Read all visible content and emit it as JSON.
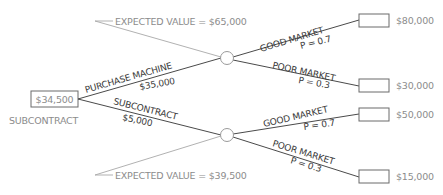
{
  "diagram": {
    "type": "decision-tree",
    "colors": {
      "branch_line": "#4a4a4a",
      "annotation_line": "#a8a8a8",
      "label_dark": "#3a3a3a",
      "label_light": "#8c8c8c"
    },
    "root": {
      "value": "$34,500",
      "caption": "SUBCONTRACT"
    },
    "decisions": [
      {
        "label": "PURCHASE MACHINE",
        "cost": "$35,000",
        "expected_value": "EXPECTED VALUE = $65,000",
        "outcomes": [
          {
            "label": "GOOD MARKET",
            "probability": "P = 0.7",
            "payoff": "$80,000"
          },
          {
            "label": "POOR MARKET",
            "probability": "P = 0.3",
            "payoff": "$30,000"
          }
        ]
      },
      {
        "label": "SUBCONTRACT",
        "cost": "$5,000",
        "expected_value": "EXPECTED VALUE = $39,500",
        "outcomes": [
          {
            "label": "GOOD MARKET",
            "probability": "P = 0.7",
            "payoff": "$50,000"
          },
          {
            "label": "POOR MARKET",
            "probability": "P = 0.3",
            "payoff": "$15,000"
          }
        ]
      }
    ]
  }
}
